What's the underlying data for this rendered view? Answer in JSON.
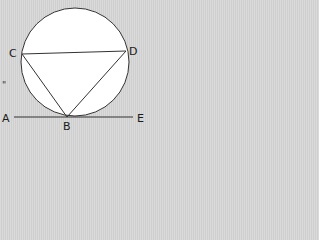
{
  "diagram": {
    "type": "circle-tangent-geometry",
    "background": "#d6d6d6",
    "circle": {
      "cx": 75,
      "cy": 62,
      "r": 54,
      "fill": "#ffffff",
      "stroke": "#333333"
    },
    "points": {
      "A": {
        "label": "A",
        "x": 14,
        "y": 117
      },
      "B": {
        "label": "B",
        "x": 67,
        "y": 117
      },
      "C": {
        "label": "C",
        "x": 22,
        "y": 54
      },
      "D": {
        "label": "D",
        "x": 126,
        "y": 51
      },
      "E": {
        "label": "E",
        "x": 133,
        "y": 117
      }
    },
    "segments": [
      "CD",
      "CB",
      "DB",
      "AE"
    ],
    "stray_mark": "\""
  }
}
